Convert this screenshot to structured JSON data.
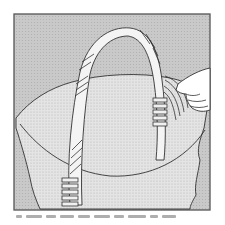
{
  "figure": {
    "frame_color": "#555555",
    "background_color": "#c8c8c8",
    "basket_fill_color": "#e2e2e2",
    "handle_fill_color": "#f4f4f4",
    "line_color": "#333333"
  },
  "caption": {
    "text_legible": false,
    "segments": [
      6,
      16,
      10,
      14,
      12,
      16,
      10,
      18,
      8,
      14
    ]
  }
}
